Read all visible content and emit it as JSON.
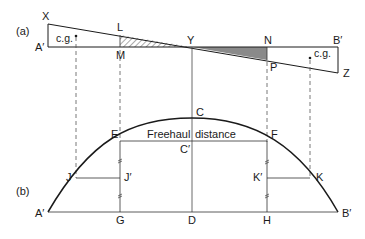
{
  "figure": {
    "panel_a": {
      "tag": "(a)",
      "points": {
        "X": "X",
        "A_prime": "A′",
        "L": "L",
        "M": "M",
        "Y": "Y",
        "N": "N",
        "P": "P",
        "B_prime": "B′",
        "Z": "Z"
      },
      "cg_left": "c.g.",
      "cg_right": "c.g."
    },
    "panel_b": {
      "tag": "(b)",
      "points": {
        "C": "C",
        "C_prime": "C′",
        "E": "E",
        "F": "F",
        "J": "J",
        "J_prime": "J′",
        "K": "K",
        "K_prime": "K′",
        "A_prime": "A′",
        "B_prime": "B′",
        "G": "G",
        "D": "D",
        "H": "H"
      },
      "freehaul_label_1": "Freehaul",
      "freehaul_label_2": "distance"
    },
    "colors": {
      "line": "#1a1a1a",
      "thin_line": "#444444",
      "shaded_fill": "#8a8a8a",
      "hatch": "#555555"
    }
  }
}
